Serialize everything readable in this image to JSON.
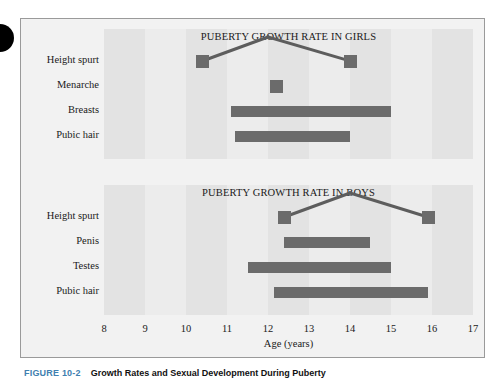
{
  "figure": {
    "caption_number": "FIGURE 10-2",
    "caption_title": "Growth Rates and Sexual Development During Puberty",
    "accent_color": "#3f7fb0",
    "bar_color": "#6b6b6b",
    "panel_background": "#ececec",
    "stripe_color": "#e3e3e3",
    "frame_background": "#f2f2f2"
  },
  "axis": {
    "title": "Age (years)",
    "ticks": [
      "8",
      "9",
      "10",
      "11",
      "12",
      "13",
      "14",
      "15",
      "16",
      "17"
    ],
    "min": 8,
    "max": 17
  },
  "chart_data": [
    {
      "type": "bar",
      "orientation": "horizontal",
      "title": "PUBERTY GROWTH RATE IN GIRLS",
      "xlabel": "Age (years)",
      "ylabel": "",
      "xlim": [
        8,
        17
      ],
      "grid": true,
      "legend": "none",
      "categories": [
        "Height spurt",
        "Menarche",
        "Breasts",
        "Pubic hair"
      ],
      "events": [
        {
          "label": "Height spurt",
          "kind": "span-with-peak",
          "start": 10.4,
          "end": 14.0,
          "peak": 12.0,
          "marker": "square"
        },
        {
          "label": "Menarche",
          "kind": "point",
          "start": 12.2,
          "end": 12.2,
          "marker": "square"
        },
        {
          "label": "Breasts",
          "kind": "range",
          "start": 11.1,
          "end": 15.0
        },
        {
          "label": "Pubic hair",
          "kind": "range",
          "start": 11.2,
          "end": 14.0
        }
      ]
    },
    {
      "type": "bar",
      "orientation": "horizontal",
      "title": "PUBERTY GROWTH RATE IN BOYS",
      "xlabel": "Age (years)",
      "ylabel": "",
      "xlim": [
        8,
        17
      ],
      "grid": true,
      "legend": "none",
      "categories": [
        "Height spurt",
        "Penis",
        "Testes",
        "Pubic hair"
      ],
      "events": [
        {
          "label": "Height spurt",
          "kind": "span-with-peak",
          "start": 12.4,
          "end": 15.9,
          "peak": 14.0,
          "marker": "square"
        },
        {
          "label": "Penis",
          "kind": "range",
          "start": 12.4,
          "end": 14.5
        },
        {
          "label": "Testes",
          "kind": "range",
          "start": 11.5,
          "end": 15.0
        },
        {
          "label": "Pubic hair",
          "kind": "range",
          "start": 12.15,
          "end": 15.9
        }
      ]
    }
  ]
}
